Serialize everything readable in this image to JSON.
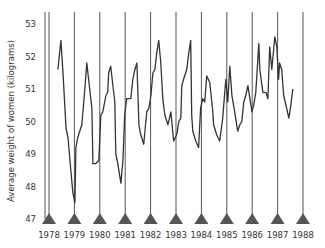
{
  "chart_data": {
    "type": "line",
    "title": "",
    "xlabel": "",
    "ylabel": "Average weight of women (kilograms)",
    "ylim": [
      47,
      53
    ],
    "xlim": [
      1978,
      1988
    ],
    "grid": "vertical lines at each year",
    "legend": null,
    "y_ticks": [
      47,
      48,
      49,
      50,
      51,
      52,
      53
    ],
    "x_ticks": [
      1978,
      1979,
      1980,
      1981,
      1982,
      1983,
      1984,
      1985,
      1986,
      1987,
      1988
    ],
    "x_tick_marker": "triangle",
    "line_color": "#333333",
    "series": [
      {
        "name": "Average weight of women",
        "x": [
          1978.35,
          1978.47,
          1978.55,
          1978.67,
          1978.75,
          1978.87,
          1978.94,
          1979.02,
          1979.06,
          1979.13,
          1979.29,
          1979.37,
          1979.49,
          1979.69,
          1979.73,
          1979.84,
          1979.96,
          1980.04,
          1980.12,
          1980.24,
          1980.31,
          1980.35,
          1980.43,
          1980.59,
          1980.63,
          1980.71,
          1980.83,
          1980.91,
          1980.98,
          1981.06,
          1981.14,
          1981.22,
          1981.3,
          1981.38,
          1981.46,
          1981.54,
          1981.61,
          1981.73,
          1981.85,
          1981.93,
          1982.01,
          1982.09,
          1982.17,
          1982.24,
          1982.32,
          1982.4,
          1982.48,
          1982.56,
          1982.68,
          1982.8,
          1982.87,
          1982.91,
          1983.03,
          1983.11,
          1983.19,
          1983.23,
          1983.3,
          1983.42,
          1983.5,
          1983.58,
          1983.62,
          1983.66,
          1983.78,
          1983.89,
          1983.97,
          1984.05,
          1984.13,
          1984.21,
          1984.33,
          1984.45,
          1984.48,
          1984.6,
          1984.72,
          1984.84,
          1984.96,
          1985.04,
          1985.12,
          1985.2,
          1985.31,
          1985.43,
          1985.51,
          1985.59,
          1985.67,
          1985.75,
          1985.83,
          1985.91,
          1985.99,
          1986.06,
          1986.14,
          1986.18,
          1986.26,
          1986.3,
          1986.42,
          1986.54,
          1986.62,
          1986.69,
          1986.77,
          1986.89,
          1986.97,
          1987.04,
          1987.08,
          1987.16,
          1987.24,
          1987.36,
          1987.44,
          1987.52,
          1987.6
        ],
        "values": [
          51.6,
          52.5,
          51.5,
          49.8,
          49.5,
          48.4,
          47.8,
          47.5,
          49.2,
          49.5,
          49.9,
          50.6,
          51.8,
          50.4,
          48.7,
          48.7,
          48.8,
          50.2,
          50.3,
          50.8,
          50.9,
          51.5,
          51.7,
          50.6,
          49.0,
          48.7,
          48.1,
          48.8,
          50.2,
          50.7,
          50.7,
          50.7,
          51.3,
          51.6,
          51.8,
          49.9,
          49.6,
          49.3,
          50.3,
          50.4,
          50.8,
          51.5,
          51.6,
          52.1,
          52.5,
          51.8,
          50.7,
          50.2,
          49.9,
          50.3,
          49.7,
          49.4,
          49.6,
          50.0,
          50.1,
          51.1,
          51.3,
          51.6,
          52.1,
          52.5,
          50.2,
          49.7,
          49.4,
          49.2,
          50.4,
          50.7,
          50.6,
          51.4,
          51.2,
          50.3,
          49.9,
          49.6,
          49.4,
          50.1,
          51.3,
          50.6,
          51.7,
          50.8,
          50.3,
          49.7,
          49.9,
          50.0,
          50.6,
          50.8,
          51.1,
          50.7,
          50.3,
          50.5,
          50.9,
          51.4,
          52.4,
          51.6,
          50.9,
          50.9,
          50.7,
          52.3,
          51.6,
          52.6,
          52.3,
          51.3,
          51.8,
          51.6,
          50.8,
          50.4,
          50.1,
          50.5,
          51.0
        ]
      }
    ]
  }
}
